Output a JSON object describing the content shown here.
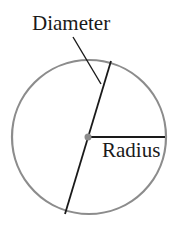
{
  "diagram": {
    "labels": {
      "diameter": "Diameter",
      "radius": "Radius"
    },
    "colors": {
      "circle": "#8c8c8c",
      "lines": "#1a1a1a",
      "center_dot": "#8c8c8c",
      "text": "#1a1a1a"
    },
    "geometry": {
      "center": [
        88,
        137
      ],
      "circle_radius": 77,
      "diameter_endpoints": [
        [
          111,
          61
        ],
        [
          65,
          214
        ]
      ],
      "radius_endpoint": [
        165,
        137
      ],
      "leader_line": [
        [
          73,
          37
        ],
        [
          101,
          84
        ]
      ]
    }
  }
}
